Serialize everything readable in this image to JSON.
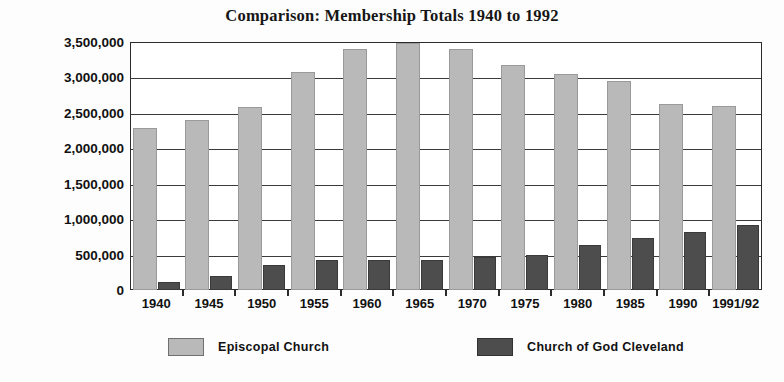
{
  "chart_data": {
    "type": "bar",
    "title": "Comparison: Membership Totals 1940 to 1992",
    "xlabel": "",
    "ylabel": "",
    "ylim": [
      0,
      3500000
    ],
    "grid": true,
    "legend_position": "bottom",
    "categories": [
      "1940",
      "1945",
      "1950",
      "1955",
      "1960",
      "1965",
      "1970",
      "1975",
      "1980",
      "1985",
      "1990",
      "1991/92"
    ],
    "ytick_labels": [
      "3,500,000",
      "3,000,000",
      "2,500,000",
      "2,000,000",
      "1,500,000",
      "1,000,000",
      "500,000",
      "0"
    ],
    "ytick_values": [
      3500000,
      3000000,
      2500000,
      2000000,
      1500000,
      1000000,
      500000,
      0
    ],
    "series": [
      {
        "name": "Episcopal Church",
        "color": "#b9b9b9",
        "values": [
          2280000,
          2400000,
          2580000,
          3080000,
          3400000,
          3480000,
          3400000,
          3170000,
          3050000,
          2950000,
          2630000,
          2600000
        ]
      },
      {
        "name": "Church of God Cleveland",
        "color": "#4d4d4d",
        "values": [
          110000,
          200000,
          350000,
          420000,
          420000,
          430000,
          470000,
          490000,
          630000,
          730000,
          820000,
          920000
        ]
      }
    ]
  },
  "legend": {
    "items": [
      {
        "label": "Episcopal Church",
        "swatch": "light"
      },
      {
        "label": "Church of God Cleveland",
        "swatch": "dark"
      }
    ]
  },
  "colors": {
    "episcopal": "#b9b9b9",
    "church_of_god": "#4d4d4d",
    "axis": "#2b2b2b",
    "background": "#ffffff"
  }
}
